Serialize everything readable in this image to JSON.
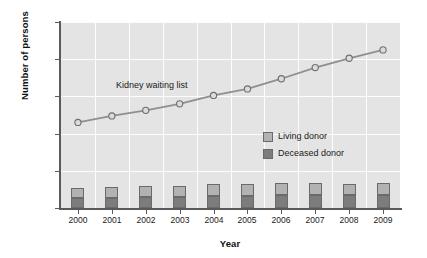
{
  "chart_data": {
    "type": "bar",
    "title": "",
    "subtitle": "",
    "xlabel": "Year",
    "ylabel": "Number of persons",
    "categories": [
      "2000",
      "2001",
      "2002",
      "2003",
      "2004",
      "2005",
      "2006",
      "2007",
      "2008",
      "2009"
    ],
    "ylim": [
      0,
      100000
    ],
    "yticks": [
      0,
      20000,
      40000,
      60000,
      80000,
      100000
    ],
    "ytick_labels": [
      "0",
      "20,000",
      "40,000",
      "60,000",
      "80,000",
      "100,000"
    ],
    "grid": true,
    "legend_position": "inside-right-middle",
    "series": [
      {
        "name": "Kidney waiting list",
        "type": "line",
        "marker": "open-circle",
        "color": "#8f8f8f",
        "values": [
          46000,
          49500,
          52500,
          56000,
          60500,
          64000,
          69500,
          75500,
          80500,
          85000
        ]
      },
      {
        "name": "Deceased donor",
        "type": "bar-stacked",
        "color": "#7c7c7c",
        "values": [
          5500,
          5600,
          5700,
          6000,
          6300,
          6500,
          6800,
          6900,
          6900,
          7000
        ]
      },
      {
        "name": "Living donor",
        "type": "bar-stacked",
        "color": "#b2b2b2",
        "values": [
          5000,
          5500,
          5900,
          6000,
          6400,
          6600,
          6500,
          6400,
          6000,
          6500
        ]
      }
    ],
    "annotations": [
      {
        "text": "Kidney waiting list",
        "x": 2001.6,
        "y": 66000
      }
    ],
    "legend_entries": [
      {
        "label": "Living donor",
        "color": "#b2b2b2"
      },
      {
        "label": "Deceased donor",
        "color": "#7c7c7c"
      }
    ]
  }
}
